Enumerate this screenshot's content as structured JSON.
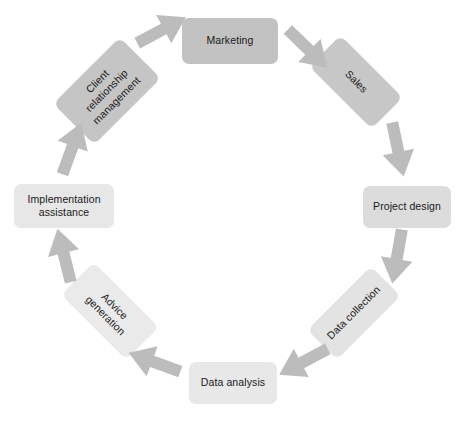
{
  "diagram": {
    "type": "cycle",
    "title": "",
    "background": "#ffffff",
    "arrow_color": "#bcbcbc",
    "center": {
      "x": 232,
      "y": 209
    },
    "radius": 168,
    "nodes": [
      {
        "id": "marketing",
        "label": "Marketing",
        "fill": "#c2c2c2",
        "rotation": 0,
        "x": 182,
        "y": 18,
        "w": 96,
        "h": 46
      },
      {
        "id": "sales",
        "label": "Sales",
        "fill": "#c7c7c7",
        "rotation": 45,
        "x": 312,
        "y": 60,
        "w": 88,
        "h": 44
      },
      {
        "id": "project-design",
        "label": "Project design",
        "fill": "#dcdcdc",
        "rotation": 0,
        "x": 363,
        "y": 186,
        "w": 88,
        "h": 42
      },
      {
        "id": "data-collection",
        "label": "Data collection",
        "fill": "#e3e3e3",
        "rotation": -45,
        "x": 309,
        "y": 292,
        "w": 90,
        "h": 42
      },
      {
        "id": "data-analysis",
        "label": "Data analysis",
        "fill": "#e8e8e8",
        "rotation": 0,
        "x": 189,
        "y": 362,
        "w": 88,
        "h": 42
      },
      {
        "id": "advice-generation",
        "label": "Advice\ngeneration",
        "fill": "#eaeaea",
        "rotation": 45,
        "x": 64,
        "y": 288,
        "w": 92,
        "h": 46
      },
      {
        "id": "implementation-assistance",
        "label": "Implementation\nassistance",
        "fill": "#e7e7e7",
        "rotation": 0,
        "x": 14,
        "y": 184,
        "w": 100,
        "h": 44
      },
      {
        "id": "client-relationship-management",
        "label": "Client\nrelationship\nmanagement",
        "fill": "#c5c5c5",
        "rotation": -45,
        "x": 60,
        "y": 62,
        "w": 94,
        "h": 58
      }
    ],
    "arrows": [
      {
        "id": "crm-to-marketing",
        "from": "client-relationship-management",
        "to": "marketing",
        "x": 134,
        "y": 13,
        "rotation": -28
      },
      {
        "id": "marketing-to-sales",
        "from": "marketing",
        "to": "sales",
        "x": 280,
        "y": 32,
        "rotation": 44
      },
      {
        "id": "sales-to-project-design",
        "from": "sales",
        "to": "project-design",
        "x": 370,
        "y": 133,
        "rotation": 78
      },
      {
        "id": "project-design-to-data-collection",
        "from": "project-design",
        "to": "data-collection",
        "x": 369,
        "y": 240,
        "rotation": 100
      },
      {
        "id": "data-collection-to-data-analysis",
        "from": "data-collection",
        "to": "data-analysis",
        "x": 275,
        "y": 345,
        "rotation": 152
      },
      {
        "id": "data-analysis-to-advice-generation",
        "from": "data-analysis",
        "to": "advice-generation",
        "x": 126,
        "y": 345,
        "rotation": 200
      },
      {
        "id": "advice-generation-to-implementation",
        "from": "advice-generation",
        "to": "implementation-assistance",
        "x": 36,
        "y": 238,
        "rotation": 256
      },
      {
        "id": "implementation-to-crm",
        "from": "implementation-assistance",
        "to": "client-relationship-management",
        "x": 44,
        "y": 131,
        "rotation": 290
      }
    ]
  }
}
